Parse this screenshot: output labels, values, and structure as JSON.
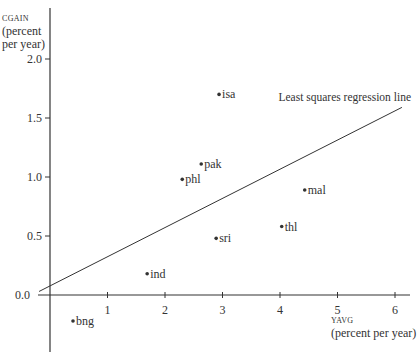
{
  "chart_data": {
    "type": "scatter",
    "title": "",
    "xlabel": "YAVG",
    "xlabel_unit": "(percent per year)",
    "ylabel": "CGAIN",
    "ylabel_unit_line1": "(percent",
    "ylabel_unit_line2": "per year)",
    "xlim": [
      -0.2,
      6.2
    ],
    "ylim": [
      -0.5,
      2.3
    ],
    "x_ticks": [
      "1",
      "2",
      "3",
      "4",
      "5",
      "6"
    ],
    "y_ticks": [
      "0.0",
      "0.5",
      "1.0",
      "1.5",
      "2.0"
    ],
    "grid": false,
    "points": [
      {
        "label": "bng",
        "x": 0.4,
        "y": -0.22
      },
      {
        "label": "ind",
        "x": 1.69,
        "y": 0.18
      },
      {
        "label": "phl",
        "x": 2.3,
        "y": 0.98
      },
      {
        "label": "pak",
        "x": 2.63,
        "y": 1.11
      },
      {
        "label": "isa",
        "x": 2.94,
        "y": 1.7
      },
      {
        "label": "sri",
        "x": 2.89,
        "y": 0.48
      },
      {
        "label": "thl",
        "x": 4.03,
        "y": 0.58
      },
      {
        "label": "mal",
        "x": 4.43,
        "y": 0.89
      }
    ],
    "regression_line": {
      "label": "Least squares regression line",
      "x": [
        -0.19,
        6.12
      ],
      "y": [
        0.03,
        1.59
      ]
    },
    "colors": {
      "ink": "#333333",
      "background": "#ffffff"
    }
  }
}
